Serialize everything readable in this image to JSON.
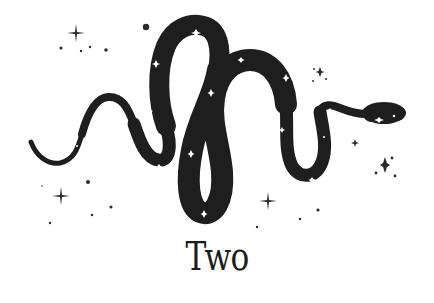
{
  "illustration": {
    "subject": "snake-icon",
    "snake_color": "#1e1e1e",
    "sparkle_color": "#ffffff",
    "star_color": "#2a2a2a",
    "background": "#ffffff"
  },
  "caption": {
    "text": "Two"
  }
}
